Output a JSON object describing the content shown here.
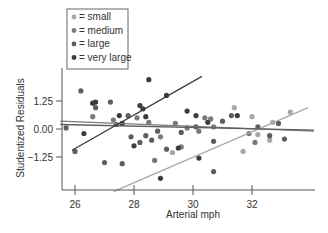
{
  "chart_data": {
    "type": "scatter",
    "title": "",
    "xlabel": "Arterial mph",
    "ylabel": "Studentized Residuals",
    "xlim": [
      25.5,
      34.2
    ],
    "ylim": [
      -2.8,
      2.7
    ],
    "xticks": [
      26,
      28,
      30,
      32
    ],
    "xtick_labels": [
      "26",
      "28",
      "30",
      "32"
    ],
    "yticks": [
      1.25,
      0.0,
      -1.25
    ],
    "ytick_labels": [
      "1.25",
      "0.00",
      "−1.25"
    ],
    "grid": false,
    "legend_position": "upper-left",
    "series": [
      {
        "name": "small",
        "legend_label": "= small",
        "color": "#a8a8a8",
        "points": [
          [
            29.3,
            -1.05
          ],
          [
            31.4,
            0.95
          ],
          [
            31.7,
            -1.0
          ],
          [
            32.0,
            0.55
          ],
          [
            32.7,
            0.3
          ],
          [
            33.3,
            0.75
          ],
          [
            32.6,
            -0.5
          ],
          [
            32.2,
            -0.25
          ]
        ],
        "fit": {
          "x": [
            27.3,
            33.9
          ],
          "y": [
            -2.8,
            0.95
          ]
        }
      },
      {
        "name": "medium",
        "legend_label": "= medium",
        "color": "#7a7a7a",
        "points": [
          [
            26.6,
            0.55
          ],
          [
            27.3,
            0.4
          ],
          [
            28.1,
            0.5
          ],
          [
            28.5,
            0.3
          ],
          [
            29.4,
            0.25
          ],
          [
            29.8,
            0.05
          ],
          [
            30.2,
            -0.1
          ],
          [
            30.4,
            0.5
          ],
          [
            30.6,
            0.45
          ],
          [
            28.9,
            -0.35
          ],
          [
            28.7,
            -1.4
          ],
          [
            30.7,
            0.1
          ],
          [
            31.9,
            -0.2
          ],
          [
            32.1,
            -0.6
          ],
          [
            29.6,
            -0.8
          ]
        ],
        "fit": {
          "x": [
            25.5,
            34.1
          ],
          "y": [
            0.35,
            -0.1
          ]
        }
      },
      {
        "name": "large",
        "legend_label": "= large",
        "color": "#5e5e5e",
        "points": [
          [
            25.7,
            0.05
          ],
          [
            26.2,
            1.7
          ],
          [
            26.7,
            0.95
          ],
          [
            27.2,
            1.2
          ],
          [
            27.4,
            0.2
          ],
          [
            27.8,
            0.6
          ],
          [
            27.9,
            -0.35
          ],
          [
            28.2,
            -0.6
          ],
          [
            28.4,
            -0.3
          ],
          [
            28.6,
            -0.5
          ],
          [
            28.8,
            -0.1
          ],
          [
            29.1,
            -0.9
          ],
          [
            29.6,
            -0.15
          ],
          [
            30.1,
            0.1
          ],
          [
            30.7,
            -0.55
          ],
          [
            31.0,
            0.35
          ],
          [
            31.3,
            0.6
          ],
          [
            26.0,
            -1.0
          ],
          [
            27.0,
            -1.5
          ],
          [
            27.6,
            -1.55
          ],
          [
            30.7,
            -1.9
          ],
          [
            32.2,
            0.1
          ],
          [
            32.6,
            -0.3
          ],
          [
            32.9,
            0.25
          ],
          [
            33.1,
            -0.45
          ]
        ],
        "fit": {
          "x": [
            25.5,
            34.1
          ],
          "y": [
            0.2,
            -0.05
          ]
        }
      },
      {
        "name": "very large",
        "legend_label": "= very large",
        "color": "#3c3c3c",
        "points": [
          [
            26.7,
            1.2
          ],
          [
            27.5,
            0.6
          ],
          [
            28.5,
            2.2
          ],
          [
            29.1,
            1.5
          ],
          [
            28.2,
            1.05
          ],
          [
            28.3,
            0.9
          ],
          [
            29.8,
            0.8
          ],
          [
            28.4,
            0.55
          ],
          [
            30.1,
            0.6
          ],
          [
            26.3,
            -0.2
          ],
          [
            26.6,
            1.15
          ],
          [
            27.6,
            0.25
          ],
          [
            29.5,
            -0.85
          ],
          [
            28.0,
            -0.75
          ],
          [
            28.9,
            -2.2
          ],
          [
            31.5,
            0.6
          ],
          [
            30.2,
            -1.3
          ],
          [
            30.5,
            0.3
          ]
        ],
        "fit": {
          "x": [
            25.9,
            30.3
          ],
          "y": [
            -0.95,
            2.35
          ]
        }
      }
    ]
  },
  "legend": {
    "items": [
      {
        "label": "= small",
        "color": "#a8a8a8"
      },
      {
        "label": "= medium",
        "color": "#7a7a7a"
      },
      {
        "label": "= large",
        "color": "#5e5e5e"
      },
      {
        "label": "= very large",
        "color": "#3c3c3c"
      }
    ]
  }
}
